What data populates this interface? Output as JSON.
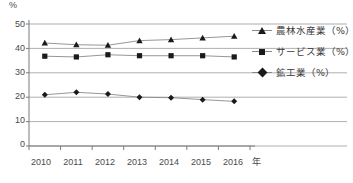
{
  "chart_data": {
    "type": "line",
    "title": "",
    "xlabel": "年",
    "ylabel": "%",
    "ylim": [
      0,
      50
    ],
    "yticks": [
      "0",
      "10",
      "20",
      "30",
      "40",
      "50"
    ],
    "grid": true,
    "legend_position": "right",
    "categories": [
      "2010",
      "2011",
      "2012",
      "2013",
      "2014",
      "2015",
      "2016"
    ],
    "series": [
      {
        "name": "農林水産業（%）",
        "marker": "triangle",
        "values": [
          42.2,
          41.5,
          41.3,
          43.2,
          43.6,
          44.3,
          45.0
        ]
      },
      {
        "name": "サービス業（%）",
        "marker": "square",
        "values": [
          36.8,
          36.5,
          37.4,
          37.0,
          37.0,
          37.0,
          36.5
        ]
      },
      {
        "name": "鉱工業（%）",
        "marker": "diamond",
        "values": [
          21.0,
          22.0,
          21.3,
          20.0,
          19.8,
          19.0,
          18.3
        ]
      }
    ],
    "colors": {
      "line": "#8a8a8a",
      "marker": "#1a1a1a",
      "grid": "#9a9a9a",
      "axis": "#7a7a7a",
      "text": "#4a4a4a"
    }
  }
}
